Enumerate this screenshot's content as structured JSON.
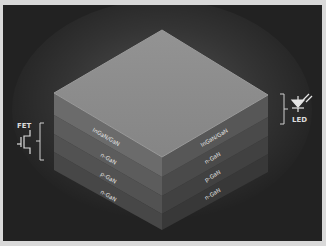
{
  "diagram": {
    "layers": [
      {
        "name": "InGaN/GaN",
        "left_label": "InGaN/GaN",
        "right_label": "InGaN/GaN",
        "color_left": "#6a6a6a",
        "color_right": "#565656"
      },
      {
        "name": "n-GaN",
        "left_label": "n-GaN",
        "right_label": "n-GaN",
        "color_left": "#5c5c5c",
        "color_right": "#4a4a4a"
      },
      {
        "name": "p-GaN",
        "left_label": "p-GaN",
        "right_label": "p-GaN",
        "color_left": "#535353",
        "color_right": "#424242"
      },
      {
        "name": "n-GaN",
        "left_label": "n-GaN",
        "right_label": "n-GaN",
        "color_left": "#494949",
        "color_right": "#3a3a3a"
      }
    ],
    "top_face_color": "#8c8c8c",
    "background_color": "#222222",
    "fet": {
      "label": "FET",
      "icon": "transistor-icon"
    },
    "led": {
      "label": "LED",
      "icon": "led-icon"
    }
  }
}
